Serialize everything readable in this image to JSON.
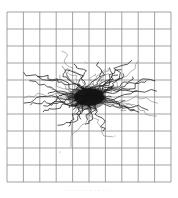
{
  "figure": {
    "type": "trajectory-plot",
    "grid": {
      "rows": 10,
      "cols": 10,
      "left": 7,
      "top": 12,
      "right": 171,
      "bottom": 182,
      "line_color": "#8a8a8a"
    },
    "cluster": {
      "center": [
        89,
        97
      ],
      "core_rx": 15,
      "core_ry": 9,
      "color": "#111111"
    },
    "trail_color": "#9a9a9a",
    "caption": "· · · · · · · · · · · ·"
  }
}
